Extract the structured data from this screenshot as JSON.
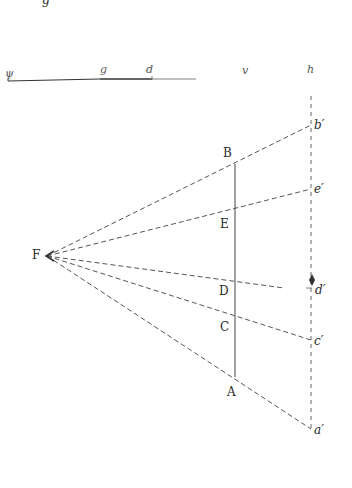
{
  "figure": {
    "top_fragment": "g",
    "scale_bar": {
      "labels": [
        {
          "id": "psi",
          "text": "ψ",
          "x": 6,
          "y": 78
        },
        {
          "id": "g",
          "text": "g",
          "x": 100,
          "y": 73
        },
        {
          "id": "d",
          "text": "d",
          "x": 146,
          "y": 73
        },
        {
          "id": "v",
          "text": "v",
          "x": 243,
          "y": 73
        },
        {
          "id": "h",
          "text": "h",
          "x": 308,
          "y": 73
        }
      ]
    },
    "focus": {
      "label": "F",
      "x": 47,
      "y": 256
    },
    "object_line": {
      "x": 235,
      "top": {
        "label": "B",
        "y": 164
      },
      "bottom": {
        "label": "A",
        "y": 377
      },
      "points": [
        {
          "label": "E",
          "y": 207
        },
        {
          "label": "D",
          "y": 279
        },
        {
          "label": "C",
          "y": 314
        }
      ]
    },
    "image_line": {
      "x": 311,
      "points": [
        {
          "label": "b′",
          "y": 125
        },
        {
          "label": "e′",
          "y": 189
        },
        {
          "label": "d′",
          "y": 281
        },
        {
          "label": "c′",
          "y": 340
        },
        {
          "label": "a′",
          "y": 429
        }
      ]
    },
    "colors": {
      "ink": "#2a2a2a",
      "dash": "#555555",
      "background": "#ffffff"
    }
  }
}
